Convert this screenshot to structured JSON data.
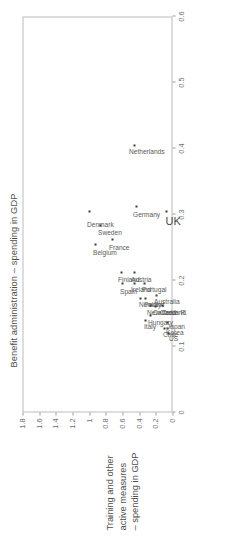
{
  "chart_data": {
    "type": "scatter",
    "title": "",
    "xlabel": "Benefit administration – spending in GDP",
    "ylabel_lines": [
      "Training and other",
      "active measures",
      "– spending in GDP"
    ],
    "ylabel": "Training and other active measures – spending in GDP",
    "xlim": [
      0,
      0.6
    ],
    "ylim": [
      0,
      1.8
    ],
    "xticks": [
      "0",
      "0.1",
      "0.2",
      "0.3",
      "0.4",
      "0.5",
      "0.6"
    ],
    "xtick_values": [
      0,
      0.1,
      0.2,
      0.3,
      0.4,
      0.5,
      0.6
    ],
    "yticks": [
      "0",
      "0.2",
      "0.4",
      "0.6",
      "0.8",
      "1",
      "1.2",
      "1.4",
      "1.6",
      "1.8"
    ],
    "ytick_values": [
      0,
      0.2,
      0.4,
      0.6,
      0.8,
      1.0,
      1.2,
      1.4,
      1.6,
      1.8
    ],
    "grid": false,
    "legend": false,
    "points": [
      {
        "label": "Denmark",
        "x": 0.305,
        "y": 1.0,
        "lx": 0.285,
        "ly": 1.07,
        "emph": false
      },
      {
        "label": "Netherlands",
        "x": 0.405,
        "y": 0.46,
        "lx": 0.395,
        "ly": 0.56,
        "emph": false
      },
      {
        "label": "Belgium",
        "x": 0.255,
        "y": 0.92,
        "lx": 0.243,
        "ly": 1.0,
        "emph": false
      },
      {
        "label": "Sweden",
        "x": 0.283,
        "y": 0.86,
        "lx": 0.272,
        "ly": 0.94,
        "emph": false
      },
      {
        "label": "France",
        "x": 0.262,
        "y": 0.72,
        "lx": 0.25,
        "ly": 0.8,
        "emph": false
      },
      {
        "label": "Germany",
        "x": 0.312,
        "y": 0.43,
        "lx": 0.3,
        "ly": 0.52,
        "emph": false
      },
      {
        "label": "UK",
        "x": 0.305,
        "y": 0.07,
        "lx": 0.291,
        "ly": 0.16,
        "emph": true
      },
      {
        "label": "Spain",
        "x": 0.196,
        "y": 0.6,
        "lx": 0.184,
        "ly": 0.67,
        "emph": false
      },
      {
        "label": "Finland",
        "x": 0.212,
        "y": 0.61,
        "lx": 0.201,
        "ly": 0.7,
        "emph": false
      },
      {
        "label": "Ireland",
        "x": 0.196,
        "y": 0.46,
        "lx": 0.186,
        "ly": 0.54,
        "emph": false
      },
      {
        "label": "Austria",
        "x": 0.212,
        "y": 0.46,
        "lx": 0.202,
        "ly": 0.54,
        "emph": false
      },
      {
        "label": "Portugal",
        "x": 0.196,
        "y": 0.34,
        "lx": 0.186,
        "ly": 0.41,
        "emph": false
      },
      {
        "label": "Norway",
        "x": 0.173,
        "y": 0.39,
        "lx": 0.163,
        "ly": 0.45,
        "emph": false
      },
      {
        "label": "Poland",
        "x": 0.173,
        "y": 0.33,
        "lx": 0.164,
        "ly": 0.39,
        "emph": false
      },
      {
        "label": "New Zealand",
        "x": 0.162,
        "y": 0.26,
        "lx": 0.152,
        "ly": 0.35,
        "emph": false
      },
      {
        "label": "Canada",
        "x": 0.16,
        "y": 0.21,
        "lx": 0.151,
        "ly": 0.28,
        "emph": false
      },
      {
        "label": "Australia",
        "x": 0.178,
        "y": 0.19,
        "lx": 0.168,
        "ly": 0.26,
        "emph": false
      },
      {
        "label": "Czech R.",
        "x": 0.162,
        "y": 0.12,
        "lx": 0.152,
        "ly": 0.19,
        "emph": false
      },
      {
        "label": "Hungary",
        "x": 0.147,
        "y": 0.27,
        "lx": 0.137,
        "ly": 0.34,
        "emph": false
      },
      {
        "label": "Italy",
        "x": 0.14,
        "y": 0.32,
        "lx": 0.13,
        "ly": 0.38,
        "emph": false
      },
      {
        "label": "Chile",
        "x": 0.128,
        "y": 0.1,
        "lx": 0.118,
        "ly": 0.16,
        "emph": false
      },
      {
        "label": "Korea",
        "x": 0.128,
        "y": 0.065,
        "lx": 0.121,
        "ly": 0.125,
        "emph": false
      },
      {
        "label": "Japan",
        "x": 0.136,
        "y": 0.055,
        "lx": 0.13,
        "ly": 0.105,
        "emph": false
      },
      {
        "label": "US",
        "x": 0.12,
        "y": 0.045,
        "lx": 0.112,
        "ly": 0.085,
        "emph": false
      }
    ]
  }
}
